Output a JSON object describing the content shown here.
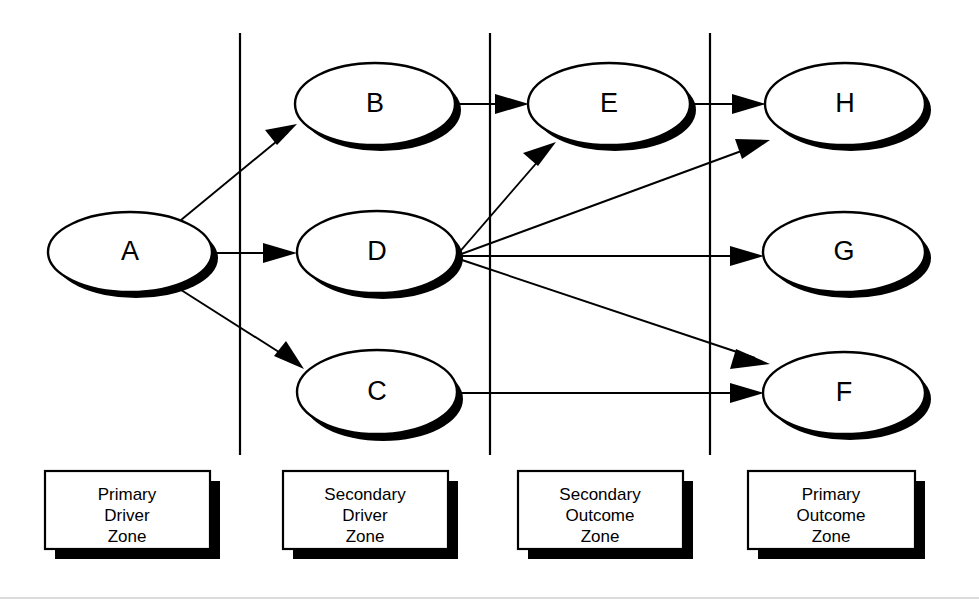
{
  "diagram": {
    "background_color": "#ffffff",
    "stroke_color": "#000000",
    "shadow_color": "#000000",
    "nodes": [
      {
        "id": "A",
        "label": "A",
        "cx": 130,
        "cy": 252,
        "rx": 82,
        "ry": 40,
        "zone": "Primary Driver Zone"
      },
      {
        "id": "B",
        "label": "B",
        "cx": 375,
        "cy": 104,
        "rx": 80,
        "ry": 41,
        "zone": "Secondary Driver Zone"
      },
      {
        "id": "D",
        "label": "D",
        "cx": 377,
        "cy": 252,
        "rx": 80,
        "ry": 41,
        "zone": "Secondary Driver Zone"
      },
      {
        "id": "C",
        "label": "C",
        "cx": 377,
        "cy": 392,
        "rx": 80,
        "ry": 42,
        "zone": "Secondary Driver Zone"
      },
      {
        "id": "E",
        "label": "E",
        "cx": 609,
        "cy": 104,
        "rx": 81,
        "ry": 41,
        "zone": "Secondary Outcome Zone"
      },
      {
        "id": "H",
        "label": "H",
        "cx": 845,
        "cy": 104,
        "rx": 80,
        "ry": 41,
        "zone": "Primary Outcome Zone"
      },
      {
        "id": "G",
        "label": "G",
        "cx": 844,
        "cy": 252,
        "rx": 81,
        "ry": 40,
        "zone": "Primary Outcome Zone"
      },
      {
        "id": "F",
        "label": "F",
        "cx": 844,
        "cy": 393,
        "rx": 81,
        "ry": 41,
        "zone": "Primary Outcome Zone"
      }
    ],
    "edges": [
      {
        "from": "A",
        "to": "B",
        "x1": 180,
        "y1": 219,
        "x2": 296,
        "y2": 125
      },
      {
        "from": "A",
        "to": "D",
        "x1": 212,
        "y1": 253,
        "x2": 296,
        "y2": 253
      },
      {
        "from": "A",
        "to": "C",
        "x1": 178,
        "y1": 287,
        "x2": 303,
        "y2": 367
      },
      {
        "from": "B",
        "to": "E",
        "x1": 455,
        "y1": 104,
        "x2": 527,
        "y2": 104
      },
      {
        "from": "D",
        "to": "E",
        "x1": 456,
        "y1": 256,
        "x2": 553,
        "y2": 144
      },
      {
        "from": "D",
        "to": "H",
        "x1": 456,
        "y1": 256,
        "x2": 768,
        "y2": 140
      },
      {
        "from": "D",
        "to": "G",
        "x1": 456,
        "y1": 256,
        "x2": 762,
        "y2": 256
      },
      {
        "from": "D",
        "to": "F",
        "x1": 456,
        "y1": 258,
        "x2": 768,
        "y2": 364
      },
      {
        "from": "C",
        "to": "F",
        "x1": 458,
        "y1": 393,
        "x2": 762,
        "y2": 393
      },
      {
        "from": "E",
        "to": "H",
        "x1": 690,
        "y1": 104,
        "x2": 764,
        "y2": 104
      }
    ],
    "dividers": [
      {
        "name": "divider-1",
        "x": 240,
        "y1": 33,
        "y2": 455
      },
      {
        "name": "divider-2",
        "x": 490,
        "y1": 33,
        "y2": 455
      },
      {
        "name": "divider-3",
        "x": 710,
        "y1": 33,
        "y2": 455
      }
    ],
    "zones": [
      {
        "id": "primary-driver-zone",
        "lines": [
          "Primary",
          "Driver",
          "Zone"
        ],
        "x": 45,
        "y": 471,
        "w": 165,
        "h": 78
      },
      {
        "id": "secondary-driver-zone",
        "lines": [
          "Secondary",
          "Driver",
          "Zone"
        ],
        "x": 283,
        "y": 471,
        "w": 165,
        "h": 78
      },
      {
        "id": "secondary-outcome-zone",
        "lines": [
          "Secondary",
          "Outcome",
          "Zone"
        ],
        "x": 518,
        "y": 471,
        "w": 165,
        "h": 78
      },
      {
        "id": "primary-outcome-zone",
        "lines": [
          "Primary",
          "Outcome",
          "Zone"
        ],
        "x": 748,
        "y": 471,
        "w": 167,
        "h": 78
      }
    ],
    "frame": {
      "bottom_rule": {
        "x1": 0,
        "y1": 598,
        "x2": 979,
        "y2": 598
      }
    }
  }
}
